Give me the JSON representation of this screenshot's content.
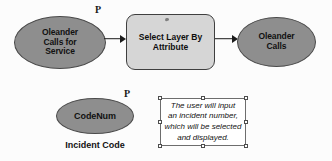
{
  "diagram": {
    "colors": {
      "data_fill": "#8e8e8e",
      "data_stroke": "#4a4a4a",
      "tool_fill": "#d6d6d6",
      "tool_stroke": "#3f3f3f",
      "connector": "#1b1b1b",
      "canvas": "#fcfcfc",
      "anno_fill": "#ffffff",
      "anno_stroke": "#6d6d6d"
    },
    "nodes": {
      "input_layer": {
        "label": "Oleander\nCalls for\nService",
        "line1": "Oleander",
        "line2": "Calls for",
        "line3": "Service",
        "type": "data-ellipse"
      },
      "tool": {
        "label": "Select Layer By\nAttribute",
        "line1": "Select Layer By",
        "line2": "Attribute",
        "type": "tool-rounded-rect"
      },
      "output_layer": {
        "label": "Oleander\nCalls",
        "line1": "Oleander",
        "line2": "Calls",
        "type": "data-ellipse"
      },
      "variable": {
        "label": "CodeNum",
        "caption": "Incident Code",
        "type": "data-ellipse"
      }
    },
    "parameter_markers": [
      {
        "name": "input-parameter-marker",
        "label": "P"
      },
      {
        "name": "variable-parameter-marker",
        "label": "P"
      }
    ],
    "connectors": [
      {
        "name": "input-to-tool",
        "from": "input_layer",
        "to": "tool"
      },
      {
        "name": "tool-to-output",
        "from": "tool",
        "to": "output_layer"
      }
    ],
    "annotation": {
      "text": "The user will input\nan incident number,\nwhich will be selected\nand displayed.",
      "selected": true,
      "handle_count": 8
    }
  }
}
